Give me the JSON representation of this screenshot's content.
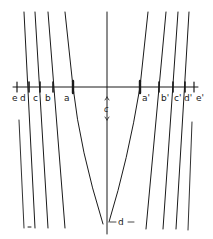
{
  "diagram": {
    "type": "line-family-with-axis",
    "stroke_color": "#1a1a1a",
    "background": "#ffffff",
    "axis_labels_left": [
      "e",
      "d",
      "c",
      "b",
      "a"
    ],
    "axis_labels_right": [
      "a'",
      "b'",
      "c'",
      "d'",
      "e'"
    ],
    "center_marker": "c",
    "bottom_marker": "d",
    "small_mark": "-"
  }
}
